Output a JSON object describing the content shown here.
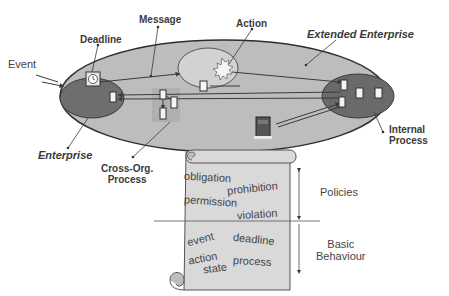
{
  "diagram": {
    "labels": {
      "event": "Event",
      "deadline": "Deadline",
      "message": "Message",
      "action": "Action",
      "extended_enterprise": "Extended Enterprise",
      "enterprise": "Enterprise",
      "cross_org_process_line1": "Cross-Org.",
      "cross_org_process_line2": "Process",
      "internal_process_line1": "Internal",
      "internal_process_line2": "Process"
    },
    "scroll": {
      "policy_terms": {
        "obligation": "obligation",
        "prohibition": "prohibition",
        "permission": "permission",
        "violation": "violation"
      },
      "behaviour_terms": {
        "event": "event",
        "deadline": "deadline",
        "action": "action",
        "state": "state",
        "process": "process"
      }
    },
    "layers": {
      "policies": "Policies",
      "basic_behaviour_line1": "Basic",
      "basic_behaviour_line2": "Behaviour"
    },
    "colors": {
      "outer_ellipse": "#bdbdbd",
      "enterprise_ellipse": "#6e6e6e",
      "action_ellipse": "#d2d2d2",
      "scroll_fill": "#d9d9d9",
      "line": "#3a3a3a"
    }
  }
}
